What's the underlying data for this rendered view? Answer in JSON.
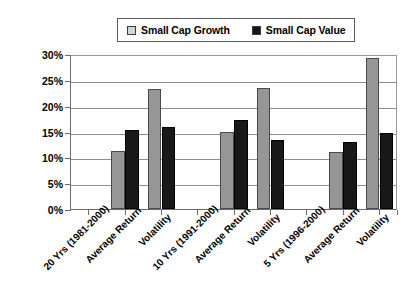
{
  "chart_data": {
    "type": "bar",
    "title": "",
    "subtitle": "",
    "xlabel": "",
    "ylabel": "",
    "ylim": [
      0,
      30
    ],
    "ytick_step": 5,
    "ytick_labels": [
      "0%",
      "5%",
      "10%",
      "15%",
      "20%",
      "25%",
      "30%"
    ],
    "ytick_values": [
      0,
      5,
      10,
      15,
      20,
      25,
      30
    ],
    "grid": true,
    "grid_axis": "y",
    "legend_position": "top-center",
    "value_unit": "%",
    "categories": [
      "20 Yrs (1981-2000)",
      "Average Return",
      "Volatility",
      "10 Yrs (1991-2000)",
      "Average Return",
      "Volatility",
      "5 Yrs (1996-2000)",
      "Average Return",
      "Volatility"
    ],
    "series": [
      {
        "name": "Small Cap Growth",
        "color": "#969696",
        "values": [
          null,
          11.2,
          23.2,
          null,
          14.9,
          23.4,
          null,
          11.1,
          29.2
        ]
      },
      {
        "name": "Small Cap Value",
        "color": "#181818",
        "values": [
          null,
          15.2,
          15.8,
          null,
          17.3,
          13.4,
          null,
          13.0,
          14.8
        ]
      }
    ],
    "groups": [
      {
        "header": "20 Yrs (1981-2000)",
        "metrics": [
          {
            "label": "Average Return",
            "small_cap_growth": 11.2,
            "small_cap_value": 15.2
          },
          {
            "label": "Volatility",
            "small_cap_growth": 23.2,
            "small_cap_value": 15.8
          }
        ]
      },
      {
        "header": "10 Yrs (1991-2000)",
        "metrics": [
          {
            "label": "Average Return",
            "small_cap_growth": 14.9,
            "small_cap_value": 17.3
          },
          {
            "label": "Volatility",
            "small_cap_growth": 23.4,
            "small_cap_value": 13.4
          }
        ]
      },
      {
        "header": "5 Yrs (1996-2000)",
        "metrics": [
          {
            "label": "Average Return",
            "small_cap_growth": 11.1,
            "small_cap_value": 13.0
          },
          {
            "label": "Volatility",
            "small_cap_growth": 29.2,
            "small_cap_value": 14.8
          }
        ]
      }
    ],
    "annotations": []
  },
  "legend": {
    "entries": [
      {
        "label": "Small Cap Growth",
        "swatch": "legend-swatch-growth",
        "color": "#d4d4d4"
      },
      {
        "label": "Small Cap Value",
        "swatch": "legend-swatch-value",
        "color": "#161616"
      }
    ]
  },
  "colors": {
    "growth_fill": "#969696",
    "growth_legend_fill": "#d4d4d4",
    "value_fill": "#181818",
    "axis": "#6b6b6b",
    "gridline": "#8e8e8e",
    "background": "#ffffff"
  }
}
